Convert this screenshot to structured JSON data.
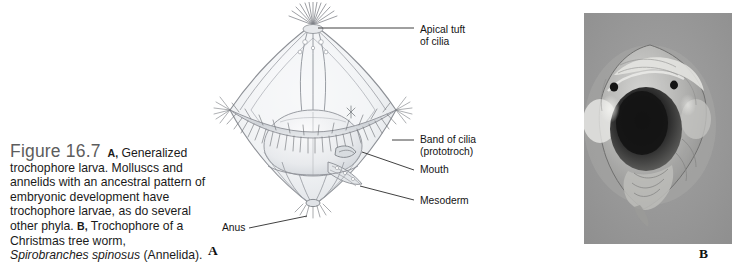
{
  "figure": {
    "number": "Figure 16.7",
    "caption_parts": {
      "tag_a": "A,",
      "text_1": " Generalized trochophore larva. Molluscs and annelids with an ancestral pattern of embryonic development have trochophore larvae, as do several other phyla. ",
      "tag_b": "B,",
      "text_2": " Trochophore of a Christmas tree worm, ",
      "species": "Spirobranches spinosus",
      "text_3": " (Annelida)."
    }
  },
  "panels": {
    "a_letter": "A",
    "b_letter": "B"
  },
  "labels": {
    "apical_tuft_line1": "Apical tuft",
    "apical_tuft_line2": "of cilia",
    "band_cilia_line1": "Band of cilia",
    "band_cilia_line2": "(prototroch)",
    "mouth": "Mouth",
    "mesoderm": "Mesoderm",
    "anus": "Anus"
  },
  "icons": {
    "diagram": "trochophore-larva-diagram",
    "photo": "trochophore-larva-micrograph"
  },
  "colors": {
    "page_background": "#ffffff",
    "caption_figure_number": "#5d5d5d",
    "caption_text": "#1a1a1a",
    "label_text": "#141414",
    "leader_line": "#2b2b2b",
    "photo_background": "#9a9a9a",
    "diagram_outline": "#8d9096",
    "diagram_fill": "#eceef0"
  }
}
